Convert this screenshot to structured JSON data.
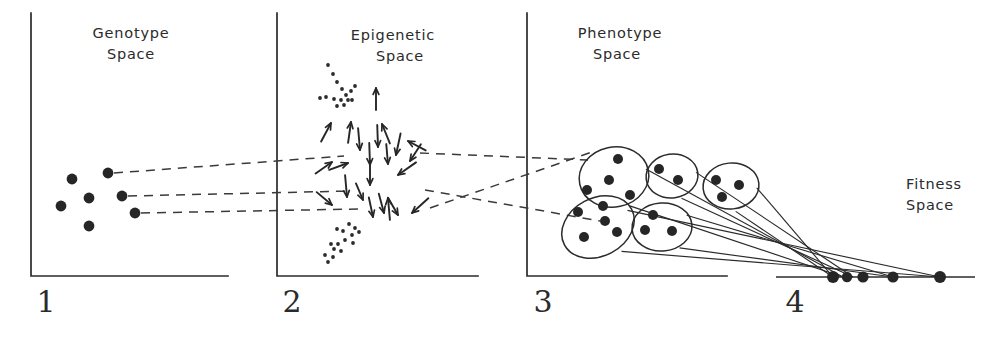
{
  "figure": {
    "caption_title": "Genotype–Epigenetic–Phenotype–Fitness Space Mapping",
    "width": 1007,
    "height": 338,
    "ink_color": "#2b2b2b",
    "background_color": "#ffffff"
  },
  "panels": [
    {
      "id": "genotype",
      "number": "1",
      "title_line1": "Genotype",
      "title_line2": "Space",
      "title_x": 131,
      "title_y1": 38,
      "title_y2": 59,
      "number_x": 46,
      "number_y": 312,
      "axis_x": 31,
      "axis_top": 13,
      "axis_bottom": 276,
      "axis_right": 228
    },
    {
      "id": "epigenetic",
      "number": "2",
      "title_line1": "Epigenetic",
      "title_line2": "Space",
      "title_x": 393,
      "title_y1": 40,
      "title_y2": 61,
      "number_x": 292,
      "number_y": 312,
      "axis_x": 277,
      "axis_top": 13,
      "axis_bottom": 276,
      "axis_right": 478
    },
    {
      "id": "phenotype",
      "number": "3",
      "title_line1": "Phenotype",
      "title_line2": "Space",
      "title_x": 620,
      "title_y1": 38,
      "title_y2": 59,
      "number_x": 543,
      "number_y": 312,
      "axis_x": 527,
      "axis_top": 13,
      "axis_bottom": 276,
      "axis_right": 727
    },
    {
      "id": "fitness",
      "number": "4",
      "title_line1": "Fitness",
      "title_line2": "Space",
      "title_x": 934,
      "title_y1": 189,
      "title_y2": 210,
      "number_x": 795,
      "number_y": 312,
      "axis_y": 277,
      "axis_left": 776,
      "axis_right": 975
    }
  ],
  "chart_data": {
    "type": "scatter",
    "xlabel": "",
    "ylabel": "",
    "panel_labels": [
      "1",
      "2",
      "3",
      "4"
    ],
    "panel_names": [
      "Genotype Space",
      "Epigenetic Space",
      "Phenotype Space",
      "Fitness Space"
    ],
    "genotype_points": [
      {
        "x": 72,
        "y": 179,
        "r": 5.4,
        "mapped": false
      },
      {
        "x": 61,
        "y": 206,
        "r": 5.4,
        "mapped": false
      },
      {
        "x": 89,
        "y": 198,
        "r": 5.4,
        "mapped": false
      },
      {
        "x": 89,
        "y": 226,
        "r": 5.4,
        "mapped": false
      },
      {
        "x": 108,
        "y": 173,
        "r": 5.4,
        "mapped": true
      },
      {
        "x": 122,
        "y": 196,
        "r": 5.4,
        "mapped": true
      },
      {
        "x": 135,
        "y": 213,
        "r": 5.4,
        "mapped": true
      }
    ],
    "genotype_to_epigenetic_links": [
      {
        "x1": 114,
        "y1": 173,
        "x2": 344,
        "y2": 156
      },
      {
        "x1": 128,
        "y1": 196,
        "x2": 352,
        "y2": 191
      },
      {
        "x1": 141,
        "y1": 213,
        "x2": 358,
        "y2": 209
      }
    ],
    "epigenetic_to_phenotype_links": [
      {
        "x1": 420,
        "y1": 153,
        "x2": 588,
        "y2": 160,
        "crosses": false
      },
      {
        "x1": 425,
        "y1": 190,
        "x2": 600,
        "y2": 221,
        "crosses": true
      },
      {
        "x1": 430,
        "y1": 208,
        "x2": 595,
        "y2": 151,
        "crosses": true
      }
    ],
    "epigenetic_arrows": [
      {
        "x": 376,
        "y": 88,
        "angle": 90,
        "len": 22
      },
      {
        "x": 331,
        "y": 123,
        "angle": 62,
        "len": 21
      },
      {
        "x": 351,
        "y": 122,
        "angle": 82,
        "len": 21
      },
      {
        "x": 382,
        "y": 124,
        "angle": 112,
        "len": 21
      },
      {
        "x": 408,
        "y": 141,
        "angle": 152,
        "len": 20
      },
      {
        "x": 360,
        "y": 150,
        "angle": 275,
        "len": 22
      },
      {
        "x": 378,
        "y": 147,
        "angle": 272,
        "len": 22
      },
      {
        "x": 396,
        "y": 155,
        "angle": 258,
        "len": 22
      },
      {
        "x": 332,
        "y": 162,
        "angle": 35,
        "len": 20
      },
      {
        "x": 348,
        "y": 163,
        "angle": 20,
        "len": 20
      },
      {
        "x": 370,
        "y": 165,
        "angle": 272,
        "len": 22
      },
      {
        "x": 388,
        "y": 164,
        "angle": 275,
        "len": 20
      },
      {
        "x": 410,
        "y": 161,
        "angle": 237,
        "len": 20
      },
      {
        "x": 398,
        "y": 175,
        "angle": 215,
        "len": 22
      },
      {
        "x": 370,
        "y": 185,
        "angle": 270,
        "len": 24
      },
      {
        "x": 347,
        "y": 197,
        "angle": 275,
        "len": 22
      },
      {
        "x": 332,
        "y": 205,
        "angle": 320,
        "len": 20
      },
      {
        "x": 363,
        "y": 200,
        "angle": 293,
        "len": 18
      },
      {
        "x": 388,
        "y": 198,
        "angle": 95,
        "len": 22
      },
      {
        "x": 373,
        "y": 217,
        "angle": 282,
        "len": 20
      },
      {
        "x": 384,
        "y": 213,
        "angle": 285,
        "len": 20
      },
      {
        "x": 398,
        "y": 215,
        "angle": 300,
        "len": 20
      },
      {
        "x": 412,
        "y": 213,
        "angle": 222,
        "len": 22
      }
    ],
    "epigenetic_stipple_upper": [
      {
        "x": 328,
        "y": 65
      },
      {
        "x": 333,
        "y": 74
      },
      {
        "x": 337,
        "y": 82
      },
      {
        "x": 342,
        "y": 89
      },
      {
        "x": 346,
        "y": 95
      },
      {
        "x": 351,
        "y": 91
      },
      {
        "x": 355,
        "y": 86
      },
      {
        "x": 348,
        "y": 100
      },
      {
        "x": 341,
        "y": 100
      },
      {
        "x": 334,
        "y": 99
      },
      {
        "x": 326,
        "y": 97
      },
      {
        "x": 320,
        "y": 98
      },
      {
        "x": 352,
        "y": 100
      },
      {
        "x": 344,
        "y": 105
      },
      {
        "x": 337,
        "y": 106
      }
    ],
    "epigenetic_stipple_lower": [
      {
        "x": 349,
        "y": 224
      },
      {
        "x": 355,
        "y": 228
      },
      {
        "x": 343,
        "y": 231
      },
      {
        "x": 352,
        "y": 235
      },
      {
        "x": 359,
        "y": 232
      },
      {
        "x": 337,
        "y": 229
      },
      {
        "x": 345,
        "y": 240
      },
      {
        "x": 353,
        "y": 243
      },
      {
        "x": 338,
        "y": 244
      },
      {
        "x": 341,
        "y": 251
      },
      {
        "x": 334,
        "y": 249
      },
      {
        "x": 333,
        "y": 257
      },
      {
        "x": 328,
        "y": 262
      },
      {
        "x": 325,
        "y": 255
      },
      {
        "x": 331,
        "y": 244
      }
    ],
    "phenotype_clusters": [
      {
        "id": "cluster-a",
        "cx": 614,
        "cy": 177,
        "rx": 35,
        "ry": 30,
        "rotation": -12,
        "points": [
          {
            "x": 618,
            "y": 159
          },
          {
            "x": 609,
            "y": 180
          },
          {
            "x": 587,
            "y": 190
          },
          {
            "x": 630,
            "y": 195
          },
          {
            "x": 603,
            "y": 206
          }
        ],
        "fitness_target": {
          "x": 843,
          "y": 277
        }
      },
      {
        "id": "cluster-b",
        "cx": 672,
        "cy": 176,
        "rx": 26,
        "ry": 22,
        "rotation": -8,
        "points": [
          {
            "x": 659,
            "y": 169
          },
          {
            "x": 678,
            "y": 180
          }
        ],
        "fitness_target": {
          "x": 853,
          "y": 277
        }
      },
      {
        "id": "cluster-c",
        "cx": 731,
        "cy": 186,
        "rx": 28,
        "ry": 23,
        "rotation": -6,
        "points": [
          {
            "x": 716,
            "y": 180
          },
          {
            "x": 739,
            "y": 185
          },
          {
            "x": 722,
            "y": 197
          }
        ],
        "fitness_target": {
          "x": 833,
          "y": 277
        }
      },
      {
        "id": "cluster-d",
        "cx": 598,
        "cy": 227,
        "rx": 38,
        "ry": 29,
        "rotation": -28,
        "points": [
          {
            "x": 578,
            "y": 212
          },
          {
            "x": 605,
            "y": 221
          },
          {
            "x": 584,
            "y": 237
          },
          {
            "x": 617,
            "y": 232
          }
        ],
        "fitness_target": {
          "x": 940,
          "y": 277
        }
      },
      {
        "id": "cluster-e",
        "cx": 662,
        "cy": 227,
        "rx": 30,
        "ry": 24,
        "rotation": -4,
        "points": [
          {
            "x": 653,
            "y": 215
          },
          {
            "x": 645,
            "y": 230
          },
          {
            "x": 672,
            "y": 231
          }
        ],
        "fitness_target": {
          "x": 893,
          "y": 277
        }
      }
    ],
    "fitness_points": [
      {
        "x": 833,
        "y": 277,
        "r": 6.0
      },
      {
        "x": 847,
        "y": 277,
        "r": 5.2
      },
      {
        "x": 863,
        "y": 277,
        "r": 5.6
      },
      {
        "x": 893,
        "y": 277,
        "r": 5.6
      },
      {
        "x": 940,
        "y": 277,
        "r": 6.0
      }
    ],
    "fitness_convergence_point": {
      "x": 812,
      "y": 245
    }
  }
}
